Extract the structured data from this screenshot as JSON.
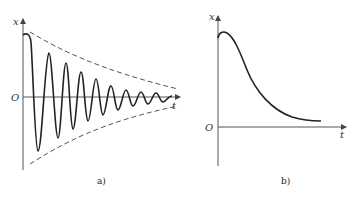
{
  "figure": {
    "panels": [
      {
        "id": "a",
        "caption": "a)",
        "y_axis_label": "x",
        "x_axis_label": "t",
        "origin_label": "O",
        "description": "Underdamped decaying oscillation within exponential envelope"
      },
      {
        "id": "b",
        "caption": "b)",
        "y_axis_label": "x",
        "x_axis_label": "t",
        "origin_label": "O",
        "description": "Overdamped non-oscillatory decay"
      }
    ],
    "colors": {
      "curve": "#222222",
      "axis": "#555555",
      "envelope": "#555555"
    }
  }
}
